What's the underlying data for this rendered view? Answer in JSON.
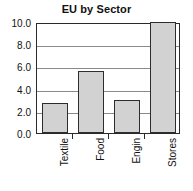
{
  "chart_data": {
    "type": "bar",
    "title": "EU by Sector",
    "xlabel": "",
    "ylabel": "",
    "categories": [
      "Textile",
      "Food",
      "Engin",
      "Stores"
    ],
    "values": [
      2.7,
      5.6,
      2.95,
      10.0
    ],
    "ylim": [
      0.0,
      10.0
    ],
    "ytick_labels": [
      "0.0",
      "2.0",
      "4.0",
      "6.0",
      "8.0",
      "10.0"
    ],
    "ytick_values": [
      0.0,
      2.0,
      4.0,
      6.0,
      8.0,
      10.0
    ],
    "grid": true,
    "legend": false,
    "legend_position": "none",
    "colors": {
      "bar_fill": "#d2d2d2",
      "bar_border": "#2d2d2d",
      "gridline": "#8a8a8a",
      "axis": "#2a2a2a",
      "text": "#111111",
      "background": "#ffffff"
    },
    "xtick_label_rotation": 90
  }
}
